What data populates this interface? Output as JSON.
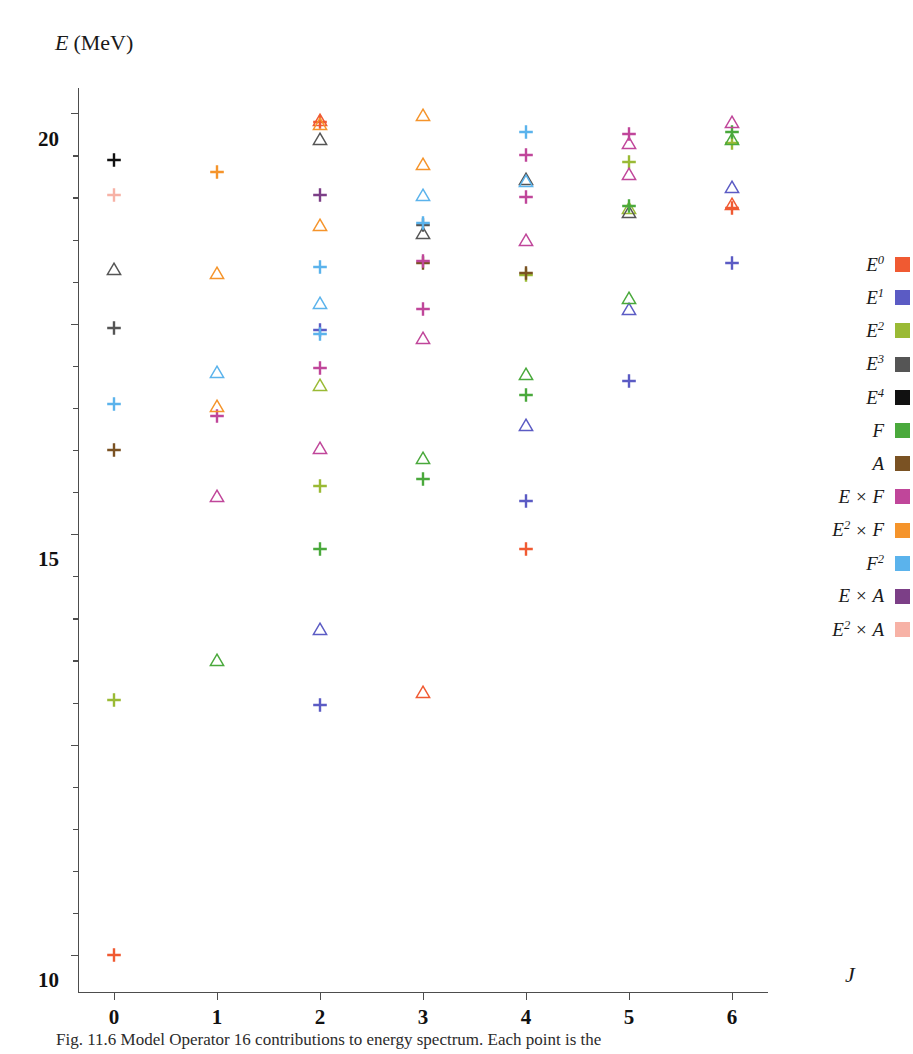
{
  "figure": {
    "caption": "Fig. 11.6  Model Operator 16 contributions to energy spectrum. Each point is the"
  },
  "chart_data": {
    "type": "scatter",
    "title": "",
    "xlabel": "J",
    "ylabel": "E (MeV)",
    "ylabel_symbol": "E",
    "ylabel_unit": "(MeV)",
    "xlim": [
      -0.35,
      6.35
    ],
    "ylim": [
      -0.9,
      20.6
    ],
    "xticks": [
      0,
      1,
      2,
      3,
      4,
      5,
      6
    ],
    "xtick_labels": [
      "0",
      "1",
      "2",
      "3",
      "4",
      "5",
      "6"
    ],
    "yticks": [
      0,
      5,
      10,
      15,
      20
    ],
    "ytick_labels": [
      "0",
      "5",
      "10",
      "15",
      "20"
    ],
    "y_minor_tick_step": 1,
    "grid": false,
    "legend_position": "right",
    "marker_shapes": [
      "cross",
      "triangle"
    ],
    "series": [
      {
        "name": "E0",
        "label_base": "E",
        "label_sup": "0",
        "color": "#f05a32",
        "points": [
          {
            "x": 0,
            "y": 0.0,
            "shape": "cross"
          },
          {
            "x": 2,
            "y": 19.8,
            "shape": "cross"
          },
          {
            "x": 2,
            "y": 19.85,
            "shape": "triangle"
          },
          {
            "x": 3,
            "y": 6.25,
            "shape": "triangle"
          },
          {
            "x": 4,
            "y": 9.65,
            "shape": "cross"
          },
          {
            "x": 6,
            "y": 17.75,
            "shape": "cross"
          },
          {
            "x": 6,
            "y": 17.85,
            "shape": "triangle"
          }
        ]
      },
      {
        "name": "E1",
        "label_base": "E",
        "label_sup": "1",
        "color": "#5b5bc4",
        "points": [
          {
            "x": 2,
            "y": 14.85,
            "shape": "cross"
          },
          {
            "x": 2,
            "y": 5.95,
            "shape": "cross"
          },
          {
            "x": 2,
            "y": 7.75,
            "shape": "triangle"
          },
          {
            "x": 4,
            "y": 12.6,
            "shape": "triangle"
          },
          {
            "x": 4,
            "y": 10.8,
            "shape": "cross"
          },
          {
            "x": 5,
            "y": 15.35,
            "shape": "triangle"
          },
          {
            "x": 5,
            "y": 13.65,
            "shape": "cross"
          },
          {
            "x": 6,
            "y": 18.25,
            "shape": "triangle"
          },
          {
            "x": 6,
            "y": 16.45,
            "shape": "cross"
          }
        ]
      },
      {
        "name": "E2",
        "label_base": "E",
        "label_sup": "2",
        "color": "#9aba35",
        "points": [
          {
            "x": 0,
            "y": 6.05,
            "shape": "cross"
          },
          {
            "x": 2,
            "y": 13.55,
            "shape": "triangle"
          },
          {
            "x": 2,
            "y": 11.15,
            "shape": "cross"
          },
          {
            "x": 4,
            "y": 16.15,
            "shape": "cross"
          },
          {
            "x": 5,
            "y": 17.75,
            "shape": "triangle"
          },
          {
            "x": 5,
            "y": 18.85,
            "shape": "cross"
          },
          {
            "x": 6,
            "y": 19.3,
            "shape": "cross"
          }
        ]
      },
      {
        "name": "E3",
        "label_base": "E",
        "label_sup": "3",
        "color": "#555555",
        "points": [
          {
            "x": 0,
            "y": 16.3,
            "shape": "triangle"
          },
          {
            "x": 0,
            "y": 14.9,
            "shape": "cross"
          },
          {
            "x": 2,
            "y": 19.4,
            "shape": "triangle"
          },
          {
            "x": 3,
            "y": 17.15,
            "shape": "triangle"
          },
          {
            "x": 3,
            "y": 17.35,
            "shape": "cross"
          },
          {
            "x": 4,
            "y": 18.45,
            "shape": "triangle"
          },
          {
            "x": 5,
            "y": 17.65,
            "shape": "triangle"
          }
        ]
      },
      {
        "name": "E4",
        "label_base": "E",
        "label_sup": "4",
        "color": "#111111",
        "points": [
          {
            "x": 0,
            "y": 18.9,
            "shape": "cross"
          }
        ]
      },
      {
        "name": "F",
        "label_base": "F",
        "label_sup": "",
        "color": "#4aa93c",
        "points": [
          {
            "x": 1,
            "y": 7.0,
            "shape": "triangle"
          },
          {
            "x": 2,
            "y": 9.65,
            "shape": "cross"
          },
          {
            "x": 3,
            "y": 11.3,
            "shape": "cross"
          },
          {
            "x": 3,
            "y": 11.8,
            "shape": "triangle"
          },
          {
            "x": 4,
            "y": 13.3,
            "shape": "cross"
          },
          {
            "x": 4,
            "y": 13.8,
            "shape": "triangle"
          },
          {
            "x": 5,
            "y": 15.6,
            "shape": "triangle"
          },
          {
            "x": 5,
            "y": 17.8,
            "shape": "cross"
          },
          {
            "x": 6,
            "y": 19.4,
            "shape": "triangle"
          },
          {
            "x": 6,
            "y": 19.55,
            "shape": "cross"
          }
        ]
      },
      {
        "name": "A",
        "label_base": "A",
        "label_sup": "",
        "color": "#7a5223",
        "points": [
          {
            "x": 0,
            "y": 12.0,
            "shape": "cross"
          },
          {
            "x": 3,
            "y": 16.45,
            "shape": "cross"
          },
          {
            "x": 4,
            "y": 16.2,
            "shape": "cross"
          }
        ]
      },
      {
        "name": "ExF",
        "label_base": "E",
        "label_sup": "",
        "label_suffix": "F",
        "color": "#c0469a",
        "points": [
          {
            "x": 1,
            "y": 12.8,
            "shape": "cross"
          },
          {
            "x": 1,
            "y": 10.9,
            "shape": "triangle"
          },
          {
            "x": 2,
            "y": 13.95,
            "shape": "cross"
          },
          {
            "x": 2,
            "y": 12.05,
            "shape": "triangle"
          },
          {
            "x": 3,
            "y": 16.5,
            "shape": "cross"
          },
          {
            "x": 3,
            "y": 15.35,
            "shape": "cross"
          },
          {
            "x": 3,
            "y": 14.65,
            "shape": "triangle"
          },
          {
            "x": 4,
            "y": 19.0,
            "shape": "cross"
          },
          {
            "x": 4,
            "y": 18.0,
            "shape": "cross"
          },
          {
            "x": 4,
            "y": 17.0,
            "shape": "triangle"
          },
          {
            "x": 5,
            "y": 19.5,
            "shape": "cross"
          },
          {
            "x": 5,
            "y": 19.3,
            "shape": "triangle"
          },
          {
            "x": 5,
            "y": 18.55,
            "shape": "triangle"
          },
          {
            "x": 6,
            "y": 19.8,
            "shape": "triangle"
          }
        ]
      },
      {
        "name": "E2xF",
        "label_base": "E",
        "label_sup": "2",
        "label_suffix": "F",
        "color": "#f5942b",
        "points": [
          {
            "x": 1,
            "y": 18.6,
            "shape": "cross"
          },
          {
            "x": 1,
            "y": 16.2,
            "shape": "triangle"
          },
          {
            "x": 1,
            "y": 13.05,
            "shape": "triangle"
          },
          {
            "x": 2,
            "y": 19.75,
            "shape": "triangle"
          },
          {
            "x": 2,
            "y": 17.35,
            "shape": "triangle"
          },
          {
            "x": 3,
            "y": 19.95,
            "shape": "triangle"
          },
          {
            "x": 3,
            "y": 18.8,
            "shape": "triangle"
          }
        ]
      },
      {
        "name": "F2",
        "label_base": "F",
        "label_sup": "2",
        "color": "#5bb3ec",
        "points": [
          {
            "x": 0,
            "y": 13.1,
            "shape": "cross"
          },
          {
            "x": 1,
            "y": 13.85,
            "shape": "triangle"
          },
          {
            "x": 2,
            "y": 16.35,
            "shape": "cross"
          },
          {
            "x": 2,
            "y": 15.5,
            "shape": "triangle"
          },
          {
            "x": 2,
            "y": 14.75,
            "shape": "cross"
          },
          {
            "x": 3,
            "y": 18.05,
            "shape": "triangle"
          },
          {
            "x": 3,
            "y": 17.4,
            "shape": "cross"
          },
          {
            "x": 4,
            "y": 19.55,
            "shape": "cross"
          },
          {
            "x": 4,
            "y": 18.4,
            "shape": "triangle"
          }
        ]
      },
      {
        "name": "ExA",
        "label_base": "E",
        "label_sup": "",
        "label_suffix": "A",
        "color": "#7c3f87",
        "points": [
          {
            "x": 2,
            "y": 18.05,
            "shape": "cross"
          }
        ]
      },
      {
        "name": "E2xA",
        "label_base": "E",
        "label_sup": "2",
        "label_suffix": "A",
        "color": "#f7b2a6",
        "points": [
          {
            "x": 0,
            "y": 18.05,
            "shape": "cross"
          }
        ]
      }
    ],
    "legend_entries": [
      {
        "label": "E0",
        "base": "E",
        "sup": "0",
        "suffix": "",
        "color": "#f05a32"
      },
      {
        "label": "E1",
        "base": "E",
        "sup": "1",
        "suffix": "",
        "color": "#5b5bc4"
      },
      {
        "label": "E2",
        "base": "E",
        "sup": "2",
        "suffix": "",
        "color": "#9aba35"
      },
      {
        "label": "E3",
        "base": "E",
        "sup": "3",
        "suffix": "",
        "color": "#555555"
      },
      {
        "label": "E4",
        "base": "E",
        "sup": "4",
        "suffix": "",
        "color": "#111111"
      },
      {
        "label": "F",
        "base": "F",
        "sup": "",
        "suffix": "",
        "color": "#4aa93c"
      },
      {
        "label": "A",
        "base": "A",
        "sup": "",
        "suffix": "",
        "color": "#7a5223"
      },
      {
        "label": "E x F",
        "base": "E",
        "sup": "",
        "suffix": "F",
        "color": "#c0469a"
      },
      {
        "label": "E2 x F",
        "base": "E",
        "sup": "2",
        "suffix": "F",
        "color": "#f5942b"
      },
      {
        "label": "F2",
        "base": "F",
        "sup": "2",
        "suffix": "",
        "color": "#5bb3ec"
      },
      {
        "label": "E x A",
        "base": "E",
        "sup": "",
        "suffix": "A",
        "color": "#7c3f87"
      },
      {
        "label": "E2 x A",
        "base": "E",
        "sup": "2",
        "suffix": "A",
        "color": "#f7b2a6"
      }
    ]
  }
}
